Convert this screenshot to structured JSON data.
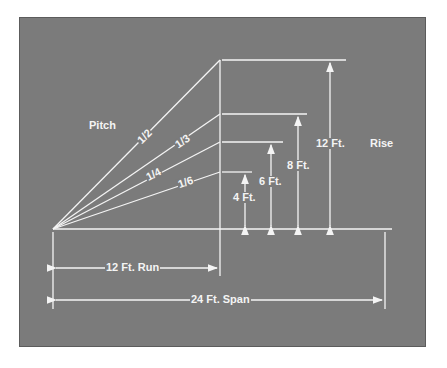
{
  "diagram": {
    "title_left": "Pitch",
    "title_right": "Rise",
    "pitches": [
      {
        "label": "1/2",
        "rise_ft": 12
      },
      {
        "label": "1/3",
        "rise_ft": 8
      },
      {
        "label": "1/4",
        "rise_ft": 6
      },
      {
        "label": "1/6",
        "rise_ft": 4
      }
    ],
    "rises": [
      {
        "label": "12 Ft."
      },
      {
        "label": "8 Ft."
      },
      {
        "label": "6 Ft."
      },
      {
        "label": "4 Ft."
      }
    ],
    "run_label": "12 Ft. Run",
    "span_label": "24 Ft. Span",
    "colors": {
      "panel": "#7b7b7b",
      "line": "#f4f4f4",
      "border": "#5c5c5c"
    }
  }
}
